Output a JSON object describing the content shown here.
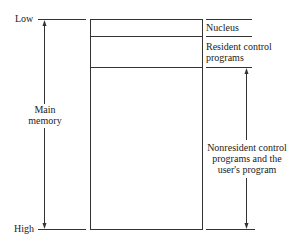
{
  "diagram": {
    "type": "memory-layout",
    "left": {
      "low_label": "Low",
      "high_label": "High",
      "span_label_line1": "Main",
      "span_label_line2": "memory"
    },
    "regions": [
      {
        "label": "Nucleus"
      },
      {
        "label_line1": "Resident control",
        "label_line2": "programs"
      },
      {
        "label_line1": "Nonresident control",
        "label_line2": "programs and the",
        "label_line3": "user's program"
      }
    ]
  }
}
